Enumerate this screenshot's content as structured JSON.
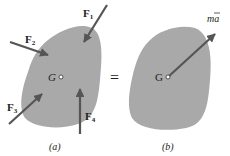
{
  "figure": {
    "panel_a": {
      "caption": "(a)",
      "center_label": "G",
      "forces": [
        {
          "name": "F",
          "sub": "1"
        },
        {
          "name": "F",
          "sub": "2"
        },
        {
          "name": "F",
          "sub": "3"
        },
        {
          "name": "F",
          "sub": "4"
        }
      ]
    },
    "equals_sign": "=",
    "panel_b": {
      "caption": "(b)",
      "center_label": "G",
      "resultant_label": "ma",
      "resultant_bar": "‾"
    },
    "colors": {
      "body_fill": "#a9a9a9",
      "arrow": "#555555",
      "text": "#222222"
    }
  }
}
